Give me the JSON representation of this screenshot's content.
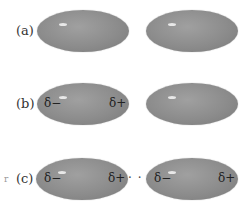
{
  "rows": [
    {
      "label": "(a)",
      "left": {
        "deltas": []
      },
      "right": {
        "deltas": []
      }
    },
    {
      "label": "(b)",
      "left": {
        "delta_left": "δ−",
        "delta_right": "δ+"
      },
      "right": {
        "deltas": []
      }
    },
    {
      "label": "(c)",
      "left": {
        "delta_left": "δ−",
        "delta_right": "δ+"
      },
      "right": {
        "delta_left": "δ−",
        "delta_right": "δ+"
      },
      "connector": "· · · ·"
    }
  ],
  "margin_mark": "r",
  "colors": {
    "ellipse": "#8c8c8c",
    "highlight": "#e8e8e8"
  }
}
